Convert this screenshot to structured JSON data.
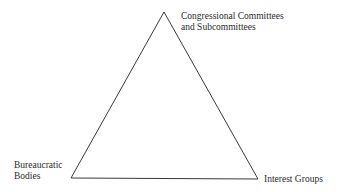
{
  "diagram": {
    "type": "triangle",
    "stroke_color": "#3a3a3a",
    "vertices": {
      "top": {
        "x": 164,
        "y": 12
      },
      "bottom_left": {
        "x": 71,
        "y": 178
      },
      "bottom_right": {
        "x": 258,
        "y": 179
      }
    },
    "nodes": [
      {
        "id": "top",
        "lines": [
          "Congressional Committees",
          "and Subcommittees"
        ]
      },
      {
        "id": "bottom_left",
        "lines": [
          "Bureaucratic",
          "Bodies"
        ]
      },
      {
        "id": "bottom_right",
        "lines": [
          "Interest Groups"
        ]
      }
    ]
  }
}
